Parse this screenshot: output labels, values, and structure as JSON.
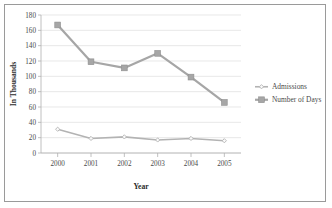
{
  "chart_data": {
    "type": "line",
    "title": "",
    "xlabel": "Year",
    "ylabel": "In Thousands",
    "categories": [
      "2000",
      "2001",
      "2002",
      "2003",
      "2004",
      "2005"
    ],
    "x": [
      2000,
      2001,
      2002,
      2003,
      2004,
      2005
    ],
    "series": [
      {
        "name": "Admissions",
        "values": [
          31,
          19,
          21,
          17,
          19,
          16
        ],
        "color": "#b3b3b3",
        "marker": "diamond"
      },
      {
        "name": "Number of Days",
        "values": [
          167,
          119,
          111,
          130,
          99,
          66
        ],
        "color": "#a6a6a6",
        "marker": "square"
      }
    ],
    "ylim": [
      0,
      180
    ],
    "yticks": [
      0,
      20,
      40,
      60,
      80,
      100,
      120,
      140,
      160,
      180
    ],
    "ytick_labels": [
      "0",
      "20",
      "40",
      "60",
      "80",
      "100",
      "120",
      "140",
      "160",
      "180"
    ],
    "xtick_labels": [
      "2000",
      "2001",
      "2002",
      "2003",
      "2004",
      "2005"
    ],
    "grid": true,
    "grid_axis": "y",
    "legend_position": "right",
    "legend_entries": [
      "Admissions",
      "Number of Days"
    ],
    "colors": {
      "admissions": "#b3b3b3",
      "number_of_days": "#a6a6a6",
      "gridline": "#d9d9d9",
      "axis": "#b0b0b0",
      "text": "#4a4a4a",
      "frame_border": "#9a9a9a",
      "background": "#ffffff"
    }
  }
}
